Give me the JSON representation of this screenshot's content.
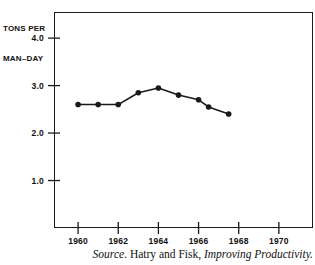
{
  "chart_data": {
    "type": "line",
    "title": "",
    "subtitle": "",
    "ylabel_line1": "TONS PER",
    "ylabel_line2": "MAN–DAY",
    "xlabel": "",
    "x": [
      1960,
      1961,
      1962,
      1963,
      1964,
      1965,
      1966,
      1966.5,
      1967.5
    ],
    "values": [
      2.6,
      2.6,
      2.6,
      2.85,
      2.95,
      2.8,
      2.7,
      2.55,
      2.4
    ],
    "series": [
      {
        "name": "Tons per man-day",
        "x": [
          1960,
          1961,
          1962,
          1963,
          1964,
          1965,
          1966,
          1966.5,
          1967.5
        ],
        "values": [
          2.6,
          2.6,
          2.6,
          2.85,
          2.95,
          2.8,
          2.7,
          2.55,
          2.4
        ]
      }
    ],
    "xlim": [
      1958.8,
      1971.7
    ],
    "ylim": [
      0.0,
      4.55
    ],
    "ytick_values": [
      1.0,
      2.0,
      3.0,
      4.0
    ],
    "ytick_labels": [
      "1.0",
      "2.0",
      "3.0",
      "4.0"
    ],
    "xtick_values": [
      1960,
      1962,
      1964,
      1966,
      1968,
      1970
    ],
    "xtick_labels": [
      "1960",
      "1962",
      "1964",
      "1966",
      "1968",
      "1970"
    ],
    "grid": false,
    "legend": "none",
    "marker": "filled-circle",
    "line_color": "#1a1a1a",
    "marker_color": "#1a1a1a",
    "frame_color": "#1a1a1a"
  },
  "caption": {
    "source_word": "Source",
    "source_punct": ". ",
    "authors": "Hatry and Fisk, ",
    "work_title": "Improving Productivity."
  }
}
